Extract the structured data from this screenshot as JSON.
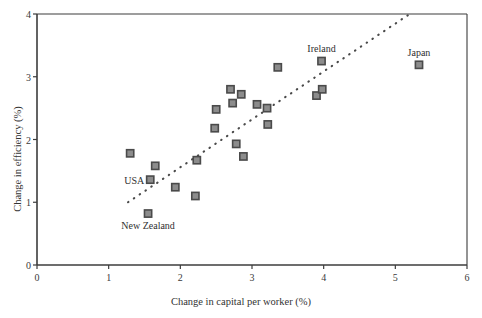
{
  "chart_data": {
    "type": "scatter",
    "title": "",
    "xlabel": "Change in capital per worker (%)",
    "ylabel": "Change in efficiency (%)",
    "xlim": [
      0,
      6
    ],
    "ylim": [
      0,
      4
    ],
    "xticks": [
      "0",
      "1",
      "2",
      "3",
      "4",
      "5",
      "6"
    ],
    "yticks": [
      "0",
      "1",
      "2",
      "3",
      "4"
    ],
    "grid": false,
    "legend": null,
    "marker_style": "filled-square-grey-with-dark-border",
    "points": [
      {
        "x": 1.3,
        "y": 1.78,
        "label": null
      },
      {
        "x": 1.55,
        "y": 0.82,
        "label": "New Zealand",
        "label_pos": "below"
      },
      {
        "x": 1.58,
        "y": 1.36,
        "label": "USA",
        "label_pos": "left"
      },
      {
        "x": 1.65,
        "y": 1.58,
        "label": null
      },
      {
        "x": 1.93,
        "y": 1.24,
        "label": null
      },
      {
        "x": 2.21,
        "y": 1.1,
        "label": null
      },
      {
        "x": 2.23,
        "y": 1.67,
        "label": null
      },
      {
        "x": 2.48,
        "y": 2.18,
        "label": null
      },
      {
        "x": 2.5,
        "y": 2.48,
        "label": null
      },
      {
        "x": 2.7,
        "y": 2.8,
        "label": null
      },
      {
        "x": 2.73,
        "y": 2.58,
        "label": null
      },
      {
        "x": 2.78,
        "y": 1.93,
        "label": null
      },
      {
        "x": 2.85,
        "y": 2.72,
        "label": null
      },
      {
        "x": 2.88,
        "y": 1.73,
        "label": null
      },
      {
        "x": 3.07,
        "y": 2.56,
        "label": null
      },
      {
        "x": 3.21,
        "y": 2.5,
        "label": null
      },
      {
        "x": 3.22,
        "y": 2.24,
        "label": null
      },
      {
        "x": 3.36,
        "y": 3.15,
        "label": null
      },
      {
        "x": 3.9,
        "y": 2.7,
        "label": null
      },
      {
        "x": 3.98,
        "y": 2.8,
        "label": null
      },
      {
        "x": 3.97,
        "y": 3.25,
        "label": "Ireland",
        "label_pos": "above"
      },
      {
        "x": 5.33,
        "y": 3.19,
        "label": "Japan",
        "label_pos": "above"
      }
    ],
    "trendline": {
      "style": "dotted",
      "x0": 1.27,
      "y0": 1.0,
      "x1": 5.2,
      "y1": 4.0
    },
    "colors": {
      "marker_fill": "#8c8c8c",
      "marker_border": "#4a4a4a",
      "axis": "#3c3c3c",
      "text": "#333333",
      "background": "#ffffff"
    }
  },
  "labels": {
    "usa": "USA",
    "new_zealand": "New Zealand",
    "ireland": "Ireland",
    "japan": "Japan"
  }
}
